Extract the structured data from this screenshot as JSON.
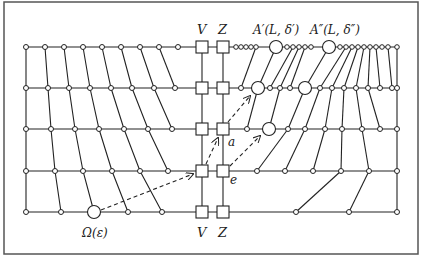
{
  "diagram": {
    "labels": {
      "v_top": "V",
      "z_top": "Z",
      "a_prime": "A′(L, δ′)",
      "a_double_prime": "A″(L, δ″)",
      "omega": "Ω(ε)",
      "a_node": "a",
      "e_node": "e",
      "v_bottom": "V",
      "z_bottom": "Z"
    },
    "colors": {
      "stroke": "#222222",
      "border": "#555555",
      "background": "#ffffff"
    },
    "rows_y": [
      47,
      88,
      129,
      171,
      212
    ],
    "columns": {
      "V_x": 202,
      "Z_x": 223
    }
  }
}
